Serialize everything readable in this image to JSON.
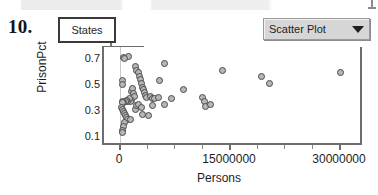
{
  "item_number": "10.",
  "collection": {
    "name": "States"
  },
  "plot_type_menu": {
    "label": "Scatter Plot",
    "caret": "chevron-down-icon"
  },
  "chart_data": {
    "type": "scatter",
    "title": "",
    "xlabel": "Persons",
    "ylabel": "PrisonPct",
    "xlim": [
      -2200000,
      33000000
    ],
    "ylim": [
      0.04,
      0.78
    ],
    "x_ticks": [
      0,
      15000000,
      30000000
    ],
    "x_tick_labels": [
      "0",
      "15000000",
      "30000000"
    ],
    "x_tick_label_clipped": "3000000",
    "y_ticks": [
      0.1,
      0.3,
      0.5,
      0.7
    ],
    "y_tick_labels": [
      "0.1",
      "0.3",
      "0.5",
      "0.7"
    ],
    "x_minor_ticks": [
      3750000,
      7500000,
      11250000,
      18750000,
      22500000,
      26250000
    ],
    "y_minor_ticks": [
      0.2,
      0.4,
      0.6
    ],
    "grid": false,
    "vertical_reference_line_x": 0,
    "legend": null,
    "marker": {
      "shape": "circle",
      "fill": "#b7b7b7",
      "edge": "#4a4a4a",
      "size_px": 7
    },
    "points": [
      {
        "x": 480000,
        "y": 0.7
      },
      {
        "x": 1100000,
        "y": 0.71
      },
      {
        "x": 620000,
        "y": 0.69
      },
      {
        "x": 300000,
        "y": 0.52
      },
      {
        "x": 330000,
        "y": 0.49
      },
      {
        "x": 2100000,
        "y": 0.63
      },
      {
        "x": 2300000,
        "y": 0.6
      },
      {
        "x": 2500000,
        "y": 0.58
      },
      {
        "x": 2600000,
        "y": 0.55
      },
      {
        "x": 2750000,
        "y": 0.53
      },
      {
        "x": 2950000,
        "y": 0.5
      },
      {
        "x": 3050000,
        "y": 0.47
      },
      {
        "x": 3200000,
        "y": 0.45
      },
      {
        "x": 3350000,
        "y": 0.43
      },
      {
        "x": 3500000,
        "y": 0.41
      },
      {
        "x": 3650000,
        "y": 0.39
      },
      {
        "x": 4100000,
        "y": 0.4
      },
      {
        "x": 4400000,
        "y": 0.38
      },
      {
        "x": 4700000,
        "y": 0.38
      },
      {
        "x": 5200000,
        "y": 0.39
      },
      {
        "x": 1500000,
        "y": 0.44
      },
      {
        "x": 1700000,
        "y": 0.46
      },
      {
        "x": 1850000,
        "y": 0.42
      },
      {
        "x": 1950000,
        "y": 0.4
      },
      {
        "x": 1600000,
        "y": 0.37
      },
      {
        "x": 1400000,
        "y": 0.36
      },
      {
        "x": 1250000,
        "y": 0.38
      },
      {
        "x": 1050000,
        "y": 0.36
      },
      {
        "x": 900000,
        "y": 0.37
      },
      {
        "x": 700000,
        "y": 0.36
      },
      {
        "x": 520000,
        "y": 0.35
      },
      {
        "x": 380000,
        "y": 0.36
      },
      {
        "x": 260000,
        "y": 0.35
      },
      {
        "x": 200000,
        "y": 0.31
      },
      {
        "x": 330000,
        "y": 0.3
      },
      {
        "x": 430000,
        "y": 0.28
      },
      {
        "x": 560000,
        "y": 0.27
      },
      {
        "x": 700000,
        "y": 0.25
      },
      {
        "x": 820000,
        "y": 0.24
      },
      {
        "x": 960000,
        "y": 0.22
      },
      {
        "x": 620000,
        "y": 0.2
      },
      {
        "x": 480000,
        "y": 0.17
      },
      {
        "x": 360000,
        "y": 0.14
      },
      {
        "x": 260000,
        "y": 0.12
      },
      {
        "x": 1450000,
        "y": 0.22
      },
      {
        "x": 2050000,
        "y": 0.3
      },
      {
        "x": 2250000,
        "y": 0.33
      },
      {
        "x": 2450000,
        "y": 0.34
      },
      {
        "x": 2900000,
        "y": 0.31
      },
      {
        "x": 3100000,
        "y": 0.26
      },
      {
        "x": 3900000,
        "y": 0.25
      },
      {
        "x": 4350000,
        "y": 0.33
      },
      {
        "x": 5400000,
        "y": 0.52
      },
      {
        "x": 6000000,
        "y": 0.65
      },
      {
        "x": 6100000,
        "y": 0.34
      },
      {
        "x": 7000000,
        "y": 0.38
      },
      {
        "x": 8700000,
        "y": 0.45
      },
      {
        "x": 11200000,
        "y": 0.39
      },
      {
        "x": 11500000,
        "y": 0.36
      },
      {
        "x": 11700000,
        "y": 0.32
      },
      {
        "x": 12300000,
        "y": 0.34
      },
      {
        "x": 14000000,
        "y": 0.6
      },
      {
        "x": 19300000,
        "y": 0.55
      },
      {
        "x": 20400000,
        "y": 0.5
      },
      {
        "x": 30000000,
        "y": 0.58
      }
    ]
  }
}
